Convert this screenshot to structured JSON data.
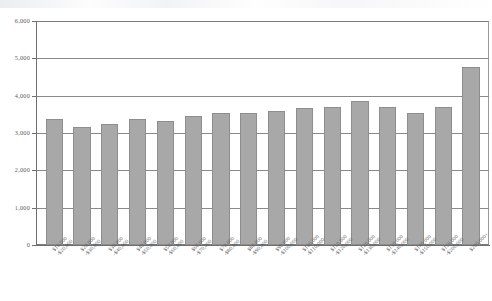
{
  "chart_data": {
    "type": "bar",
    "title": "",
    "subtitle": "",
    "xlabel": "",
    "ylabel": "",
    "ylim": [
      0,
      6000
    ],
    "yticks": [
      0,
      1000,
      2000,
      3000,
      4000,
      5000,
      6000
    ],
    "ytick_labels": [
      "0",
      "1,000",
      "2,000",
      "3,000",
      "4,000",
      "5,000",
      "6,000"
    ],
    "grid": true,
    "legend": null,
    "bar_color": "#a8a8a8",
    "bar_edge_color": "#8e8e8e",
    "axis_color": "#6f6f6f",
    "categories": [
      "$10,000-$20,000",
      "$20,000-$30,000",
      "$30,000-$40,000",
      "$40,000-$50,000",
      "$50,000-$60,000",
      "$60,000-$70,000",
      "$70,000-$80,000",
      "$80,000-$90,000",
      "$90,000-$100,000",
      "$100,000-$110,000",
      "$110,000-$120,000",
      "$120,000-$130,000",
      "$130,000-$140,000",
      "$140,000-$150,000",
      "$150,000-$200,000",
      "$200,000+"
    ],
    "categories_display": [
      [
        "$10,000",
        "-$20,000"
      ],
      [
        "$20,000",
        "-$30,000"
      ],
      [
        "$30,000",
        "-$40,000"
      ],
      [
        "$40,000",
        "-$50,000"
      ],
      [
        "$50,000",
        "-$60,000"
      ],
      [
        "$60,000",
        "-$70,000"
      ],
      [
        "$70,000",
        "-$80,000"
      ],
      [
        "$80,000",
        "-$90,000"
      ],
      [
        "$90,000",
        "-$100,000"
      ],
      [
        "$100,000",
        "-$110,000"
      ],
      [
        "$110,000",
        "-$120,000"
      ],
      [
        "$120,000",
        "-$130,000"
      ],
      [
        "$130,000",
        "-$140,000"
      ],
      [
        "$140,000",
        "-$150,000"
      ],
      [
        "$150,000",
        "-$200,000"
      ],
      [
        "$200,000+",
        ""
      ]
    ],
    "values": [
      3370,
      3150,
      3240,
      3370,
      3330,
      3450,
      3540,
      3540,
      3600,
      3670,
      3700,
      3850,
      3700,
      3540,
      3700,
      4780
    ],
    "n_bars": 16
  }
}
